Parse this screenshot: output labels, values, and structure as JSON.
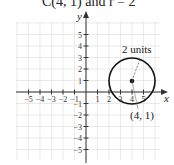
{
  "title": "C(4, 1) and r = 2",
  "axes": {
    "x_label": "x",
    "y_label": "y"
  },
  "x_ticks": [
    "−5",
    "−4",
    "−3",
    "−2",
    "−1",
    "1",
    "2",
    "3",
    "4",
    "5"
  ],
  "y_ticks": [
    "5",
    "4",
    "3",
    "2",
    "1",
    "−1",
    "−2",
    "−3",
    "−4",
    "−5"
  ],
  "circle": {
    "center": [
      4,
      1
    ],
    "radius": 2
  },
  "annotations": {
    "radius_label": "2 units",
    "center_label": "(4, 1)"
  },
  "colors": {
    "grid": "#d8d8d8",
    "axis": "#333333",
    "circle": "#111111"
  },
  "chart_data": {
    "type": "diagram",
    "title": "C(4, 1) and r = 2",
    "xlabel": "x",
    "ylabel": "y",
    "xlim": [
      -5,
      5
    ],
    "ylim": [
      -5,
      5
    ],
    "grid": true,
    "circle": {
      "center": [
        4,
        1
      ],
      "radius": 2
    },
    "annotations": [
      "2 units",
      "(4, 1)"
    ]
  }
}
